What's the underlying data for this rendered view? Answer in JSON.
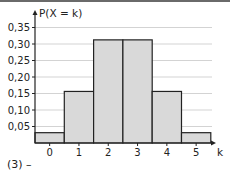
{
  "chart_data": {
    "type": "bar",
    "title": "",
    "xlabel": "k",
    "ylabel": "P(X = k)",
    "categories": [
      "0",
      "1",
      "2",
      "3",
      "4",
      "5"
    ],
    "values": [
      0.03125,
      0.15625,
      0.3125,
      0.3125,
      0.15625,
      0.03125
    ],
    "yticks": [
      0.05,
      0.1,
      0.15,
      0.2,
      0.25,
      0.3,
      0.35
    ],
    "ytick_labels": [
      "0,05",
      "0,10",
      "0,15",
      "0,20",
      "0,25",
      "0,30",
      "0,35"
    ],
    "ylim": [
      0,
      0.38
    ],
    "grid": true,
    "bar_fill": "#d9d9d9",
    "bar_stroke": "#222222",
    "grid_color": "#c8c8c8"
  },
  "caption": "(3)  –"
}
